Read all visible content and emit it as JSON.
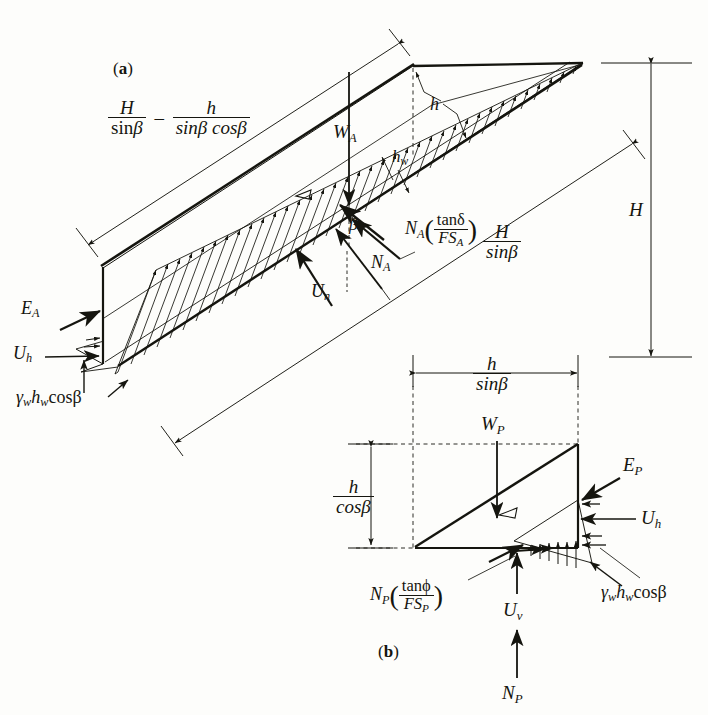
{
  "figure": {
    "kind": "two-wedge slope stability free-body diagram",
    "background_color": "#fdfdfb",
    "ink_color": "#15150f"
  },
  "panel_a": {
    "tag_open": "(",
    "tag_letter": "a",
    "tag_close": ")",
    "labels": {
      "upper_dim_left_num": "H",
      "upper_dim_left_den_sin": "sin",
      "upper_dim_left_den_beta": "β",
      "upper_dim_minus": "–",
      "upper_dim_right_num": "h",
      "upper_dim_right_den": "sinβ cosβ",
      "weight": "W",
      "weight_sub": "A",
      "h_small": "h",
      "hw": "h",
      "hw_sub": "w",
      "beta_angle": "β",
      "normal_force": "N",
      "normal_force_sub": "A",
      "shear_force_main": "N",
      "shear_force_sub": "A",
      "shear_force_num": "tanδ",
      "shear_force_den_fs": "FS",
      "shear_force_den_sub": "A",
      "uplift_normal": "U",
      "uplift_normal_sub": "n",
      "active_thrust": "E",
      "active_thrust_sub": "A",
      "uplift_horiz": "U",
      "uplift_horiz_sub": "h",
      "water_pressure": "γ",
      "water_pressure_sub1": "w",
      "water_pressure_h": "h",
      "water_pressure_sub2": "w",
      "water_pressure_cos": "cosβ",
      "slope_len_num": "H",
      "slope_len_den": "sinβ",
      "height_dim": "H"
    }
  },
  "panel_b": {
    "tag_open": "(",
    "tag_letter": "b",
    "tag_close": ")",
    "labels": {
      "top_dim_num": "h",
      "top_dim_den": "sinβ",
      "left_dim_num": "h",
      "left_dim_den": "cosβ",
      "weight": "W",
      "weight_sub": "P",
      "passive_thrust": "E",
      "passive_thrust_sub": "P",
      "uplift_horiz": "U",
      "uplift_horiz_sub": "h",
      "shear_force_main": "N",
      "shear_force_sub": "P",
      "shear_force_num": "tanϕ",
      "shear_force_den_fs": "FS",
      "shear_force_den_sub": "P",
      "water_pressure": "γ",
      "water_pressure_sub1": "w",
      "water_pressure_h": "h",
      "water_pressure_sub2": "w",
      "water_pressure_cos": "cosβ",
      "uplift_vert": "U",
      "uplift_vert_sub": "v",
      "normal_force": "N",
      "normal_force_sub": "P"
    }
  }
}
